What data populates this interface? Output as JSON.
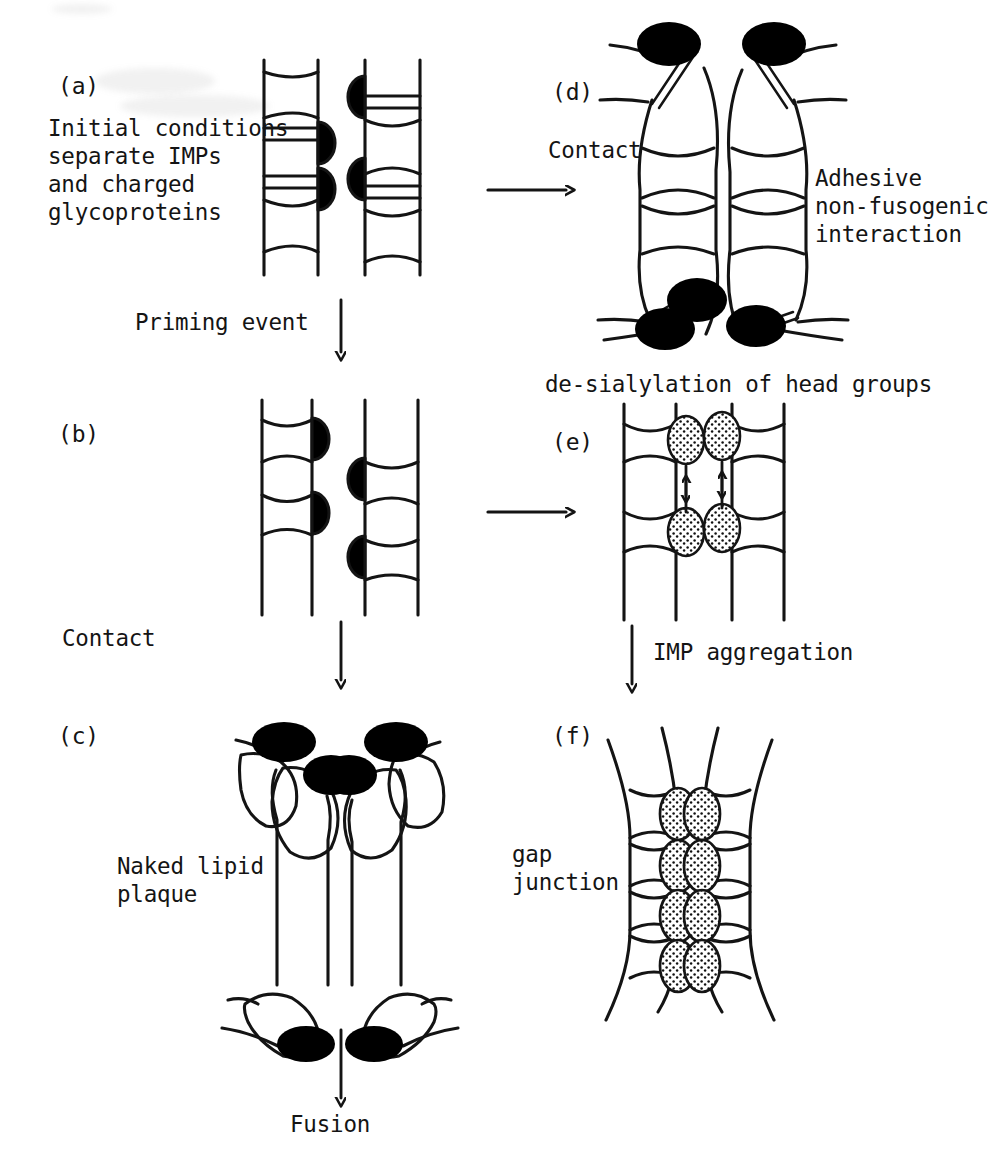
{
  "figure": {
    "style": "hand-drawn line art, typewriter labels",
    "background_color": "#ffffff",
    "ink_color": "#141414",
    "protein_fill": "#000000",
    "imp_fill": "#ffffff",
    "stipple_fill": "#ffffff"
  },
  "panels": [
    {
      "id": "a",
      "label": "(a)",
      "caption": "Initial conditions\nseparate IMPs\nand charged\nglycoproteins",
      "description": "two flat apposed bilayer membranes with lens-shaped IMPs and black glycoprotein caps facing the cleft"
    },
    {
      "id": "b",
      "label": "(b)",
      "caption": "",
      "description": "flat membranes after priming, glycoproteins paired with IMPs at the facing surfaces"
    },
    {
      "id": "c",
      "label": "(c)",
      "caption": "Naked lipid\nplaque",
      "description": "membranes drawn into narrow apposed tubes, IMPs and glycoproteins cleared to top and bottom leaving bare lipid"
    },
    {
      "id": "d",
      "label": "(d)",
      "caption": "Adhesive\nnon-fusogenic\ninteraction",
      "description": "bulged membranes with glycoproteins displaced to the poles on double-line stalks, IMPs retained in the contact zone"
    },
    {
      "id": "e",
      "label": "(e)",
      "caption": "",
      "description": "flat membranes with stippled de-sialylated IMPs at the facing surfaces, small arrows showing lateral movement"
    },
    {
      "id": "f",
      "label": "(f)",
      "caption": "gap\njunction",
      "description": "aggregated stippled IMPs forming a gap junction plaque between two membranes"
    }
  ],
  "arrows": [
    {
      "name": "priming-event",
      "label": "Priming event",
      "direction": "down"
    },
    {
      "name": "contact-left",
      "label": "Contact",
      "direction": "down"
    },
    {
      "name": "fusion",
      "label": "Fusion",
      "direction": "down"
    },
    {
      "name": "contact-right",
      "label": "Contact",
      "direction": "right"
    },
    {
      "name": "desialylation",
      "label": "de-sialylation of head groups",
      "direction": "right"
    },
    {
      "name": "imp-aggregation",
      "label": "IMP aggregation",
      "direction": "down"
    }
  ],
  "labels": {
    "panel_a_id": "(a)",
    "panel_b_id": "(b)",
    "panel_c_id": "(c)",
    "panel_d_id": "(d)",
    "panel_e_id": "(e)",
    "panel_f_id": "(f)",
    "initial_conditions_l1": "Initial conditions",
    "initial_conditions_l2": "separate IMPs",
    "initial_conditions_l3": "and charged",
    "initial_conditions_l4": "glycoproteins",
    "priming_event": "Priming event",
    "contact_left": "Contact",
    "naked_lipid_l1": "Naked lipid",
    "naked_lipid_l2": "plaque",
    "fusion": "Fusion",
    "contact_right": "Contact",
    "adhesive_l1": "Adhesive",
    "adhesive_l2": "non-fusogenic",
    "adhesive_l3": "interaction",
    "desialylation": "de-sialylation of head groups",
    "imp_aggregation": "IMP aggregation",
    "gap_junction_l1": "gap",
    "gap_junction_l2": "junction"
  }
}
